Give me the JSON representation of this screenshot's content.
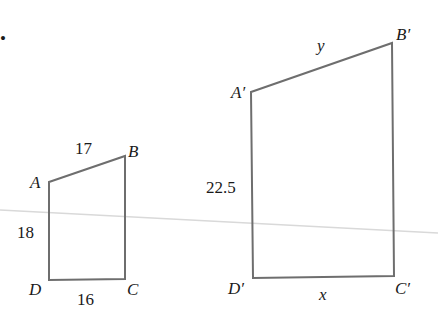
{
  "marker": "•",
  "small_quad": {
    "vertices": {
      "A": "A",
      "B": "B",
      "C": "C",
      "D": "D"
    },
    "sides": {
      "AB": "17",
      "AD": "18",
      "DC": "16"
    }
  },
  "large_quad": {
    "vertices": {
      "A": "A′",
      "B": "B′",
      "C": "C′",
      "D": "D′"
    },
    "sides": {
      "AB": "y",
      "AD": "22.5",
      "DC": "x"
    }
  },
  "colors": {
    "stroke": "#6e6e6e",
    "text": "#1a1a1a",
    "faint_line": "#d9d9d9"
  }
}
